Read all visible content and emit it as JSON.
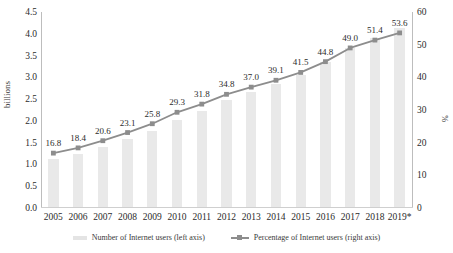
{
  "chart_data": {
    "type": "bar",
    "title": "",
    "xlabel": "",
    "ylabel": "billions",
    "ylabel_right": "%",
    "categories": [
      "2005",
      "2006",
      "2007",
      "2008",
      "2009",
      "2010",
      "2011",
      "2012",
      "2013",
      "2014",
      "2015",
      "2016",
      "2017",
      "2018",
      "2019*"
    ],
    "series": [
      {
        "name": "Number of Internet users (left axis)",
        "type": "bar",
        "axis": "left",
        "unit": "billions",
        "color": "#e9e9e9",
        "values": [
          1.1,
          1.21,
          1.37,
          1.56,
          1.75,
          2.0,
          2.2,
          2.45,
          2.63,
          2.82,
          3.04,
          3.32,
          3.65,
          3.87,
          4.1
        ]
      },
      {
        "name": "Percentage of Internet users (right axis)",
        "type": "line",
        "axis": "right",
        "unit": "%",
        "color": "#8d8d8d",
        "values": [
          16.8,
          18.4,
          20.6,
          23.1,
          25.8,
          29.3,
          31.8,
          34.8,
          37.0,
          39.1,
          41.5,
          44.8,
          49.0,
          51.4,
          53.6
        ],
        "data_labels": [
          "16.8",
          "18.4",
          "20.6",
          "23.1",
          "25.8",
          "29.3",
          "31.8",
          "34.8",
          "37.0",
          "39.1",
          "41.5",
          "44.8",
          "49.0",
          "51.4",
          "53.6"
        ]
      }
    ],
    "yticks_left": [
      "0.0",
      "0.5",
      "1.0",
      "1.5",
      "2.0",
      "2.5",
      "3.0",
      "3.5",
      "4.0",
      "4.5"
    ],
    "ylim_left": [
      0,
      4.5
    ],
    "yticks_right": [
      "0",
      "10",
      "20",
      "30",
      "40",
      "50",
      "60"
    ],
    "ylim_right": [
      0,
      60
    ],
    "grid": false,
    "legend_position": "bottom",
    "legend": [
      "Number of Internet users (left axis)",
      "Percentage of Internet users (right axis)"
    ]
  }
}
